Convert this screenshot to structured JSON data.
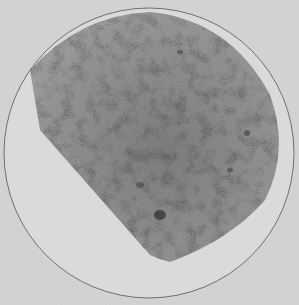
{
  "figure": {
    "colors": {
      "background": "#d6d6d6",
      "disk": "#dadada",
      "circle_outline": "#555555",
      "dense_region": "#6e6e6e",
      "dark_knots": "#2e2e2e"
    },
    "circle": {
      "cx": 149,
      "cy": 153,
      "r": 145
    }
  }
}
